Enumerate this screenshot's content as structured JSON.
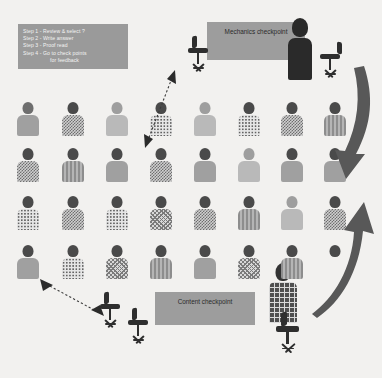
{
  "background_color": "#f2f1ef",
  "instructions": {
    "name": "steps-panel",
    "background_color": "#9a9a9a",
    "text_color": "#f4f4f4",
    "lines": [
      "Step 1 - Review & select ?",
      "Step 2 - Write answer",
      "Step 3 - Proof read",
      "Step 4 - Go to check points",
      "for feedback"
    ]
  },
  "banners": {
    "mechanics": {
      "label": "Mechanics checkpoint",
      "color": "#9d9d9d",
      "text_color": "#2b2b2b"
    },
    "content": {
      "label": "Content checkpoint",
      "color": "#9d9d9d",
      "text_color": "#2b2b2b"
    }
  },
  "figures": {
    "teacher": {
      "name": "teacher-figure",
      "color": "#2a2a2a",
      "position": "top-right"
    },
    "seated_student": {
      "name": "seated-student-figure",
      "pattern": "plaid",
      "position": "bottom-right"
    }
  },
  "students": {
    "rows": 4,
    "columns": 8,
    "count": 32,
    "grid": [
      [
        {
          "head": "mid",
          "body": "solid-md"
        },
        {
          "head": "dark",
          "body": "check"
        },
        {
          "head": "lt",
          "body": "solid-lt"
        },
        {
          "head": "dark",
          "body": "dot"
        },
        {
          "head": "lt",
          "body": "solid-lt"
        },
        {
          "head": "dark",
          "body": "dot"
        },
        {
          "head": "dark",
          "body": "check"
        },
        {
          "head": "dark",
          "body": "vstripe"
        }
      ],
      [
        {
          "head": "dark",
          "body": "check"
        },
        {
          "head": "dark",
          "body": "vstripe"
        },
        {
          "head": "dark",
          "body": "solid-md"
        },
        {
          "head": "dark",
          "body": "check"
        },
        {
          "head": "dark",
          "body": "solid-md"
        },
        {
          "head": "lt",
          "body": "solid-lt"
        },
        {
          "head": "dark",
          "body": "solid-md"
        },
        {
          "head": "dark",
          "body": "solid-md"
        }
      ],
      [
        {
          "head": "dark",
          "body": "dot"
        },
        {
          "head": "dark",
          "body": "check"
        },
        {
          "head": "dark",
          "body": "dot"
        },
        {
          "head": "dark",
          "body": "zig"
        },
        {
          "head": "dark",
          "body": "check"
        },
        {
          "head": "dark",
          "body": "vstripe"
        },
        {
          "head": "lt",
          "body": "solid-lt"
        },
        {
          "head": "dark",
          "body": "check"
        }
      ],
      [
        {
          "head": "dark",
          "body": "solid-md"
        },
        {
          "head": "dark",
          "body": "dot"
        },
        {
          "head": "dark",
          "body": "zig"
        },
        {
          "head": "dark",
          "body": "vstripe"
        },
        {
          "head": "dark",
          "body": "solid-md"
        },
        {
          "head": "dark",
          "body": "zig"
        },
        {
          "head": "dark",
          "body": "vstripe"
        },
        {
          "head": "dark",
          "body": "none"
        }
      ]
    ]
  },
  "chairs": [
    {
      "name": "chair-mechanics-left",
      "color": "#2e2e2e"
    },
    {
      "name": "chair-mechanics-right",
      "color": "#2e2e2e"
    },
    {
      "name": "chair-content-left",
      "color": "#2e2e2e"
    },
    {
      "name": "chair-content-right",
      "color": "#2e2e2e"
    },
    {
      "name": "chair-seated-student",
      "color": "#2e2e2e"
    }
  ],
  "arrows": [
    {
      "name": "curved-arrow-down-right",
      "style": "solid",
      "color": "#585858",
      "direction": "down"
    },
    {
      "name": "curved-arrow-up-right",
      "style": "solid",
      "color": "#585858",
      "direction": "up"
    },
    {
      "name": "dotted-arrow-to-mechanics",
      "style": "dotted",
      "color": "#3a3a3a",
      "direction": "bidirectional"
    },
    {
      "name": "dotted-arrow-to-content",
      "style": "dotted",
      "color": "#3a3a3a",
      "direction": "bidirectional"
    }
  ]
}
